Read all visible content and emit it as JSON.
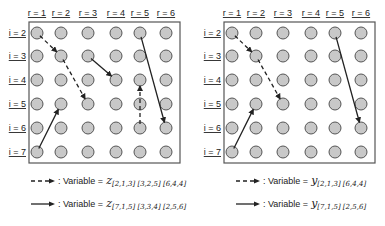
{
  "colors": {
    "node_fill": "#c8c8c8",
    "node_stroke": "#555555",
    "border": "#555555",
    "arrow": "#222222"
  },
  "grid": {
    "col_labels": [
      "r = 1",
      "r = 2",
      "r = 3",
      "r = 4",
      "r = 5",
      "r = 6"
    ],
    "row_labels": [
      "i = 2",
      "i = 3",
      "i = 4",
      "i = 5",
      "i = 6",
      "i = 7"
    ],
    "col_x": [
      37,
      61,
      88,
      116,
      140,
      166
    ],
    "row_y": [
      33,
      56,
      80,
      104,
      128,
      152
    ]
  },
  "panels": [
    {
      "name": "z",
      "offset_x": 0,
      "dashed_arrows": [
        [
          1,
          2,
          2,
          3
        ],
        [
          2,
          3,
          3,
          5
        ],
        [
          5,
          6,
          5,
          4
        ]
      ],
      "solid_arrows": [
        [
          1,
          7,
          2,
          5
        ],
        [
          3,
          3,
          4,
          4
        ],
        [
          5,
          2,
          6,
          6
        ]
      ],
      "legend": {
        "dashed_label": ": Variable = ",
        "dashed_symbol": "z",
        "dashed_sub": "[2,1,3] [3,2,5] [6,4,4]",
        "solid_label": ": Variable = ",
        "solid_symbol": "z",
        "solid_sub": "[7,1,5] [3,3,4] [2,5,6]"
      }
    },
    {
      "name": "y",
      "offset_x": 195,
      "dashed_arrows": [
        [
          1,
          2,
          2,
          3
        ],
        [
          2,
          3,
          3,
          5
        ]
      ],
      "solid_arrows": [
        [
          1,
          7,
          2,
          5
        ],
        [
          5,
          2,
          6,
          6
        ]
      ],
      "legend": {
        "dashed_label": ": Variable = ",
        "dashed_symbol": "y",
        "dashed_sub": "[2,1,3] [6,4,4]",
        "solid_label": ": Variable = ",
        "solid_symbol": "y",
        "solid_sub": "[7,1,5] [2,5,6]"
      }
    }
  ]
}
